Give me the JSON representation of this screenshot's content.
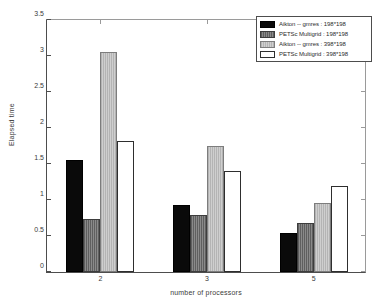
{
  "chart_data": {
    "type": "bar",
    "title": "",
    "xlabel": "number of processors",
    "ylabel": "Elapsed time",
    "categories": [
      "2",
      "3",
      "5"
    ],
    "ylim": [
      0,
      3.5
    ],
    "yticks": [
      "0",
      "0.5",
      "1",
      "1.5",
      "2",
      "2.5",
      "3",
      "3.5"
    ],
    "ytick_values": [
      0,
      0.5,
      1,
      1.5,
      2,
      2.5,
      3,
      3.5
    ],
    "grid": false,
    "legend_position": "top-right",
    "series": [
      {
        "name": "Aikton -- gmres : 198*198",
        "color": "#0a0a0a",
        "values": [
          1.54,
          0.92,
          0.54
        ]
      },
      {
        "name": "PETSc Multigrid : 198*198",
        "color": "#767676",
        "values": [
          0.73,
          0.78,
          0.68
        ]
      },
      {
        "name": "Aikton -- gmres : 398*198",
        "color": "#c2c2c2",
        "values": [
          3.03,
          1.74,
          0.95
        ]
      },
      {
        "name": "PETSc Multigrid : 398*198",
        "color": "#ffffff",
        "values": [
          1.8,
          1.39,
          1.19
        ]
      }
    ]
  },
  "legend": {
    "entries": [
      "Aikton -- gmres : 198*198",
      "PETSc Multigrid : 198*198",
      "Aikton -- gmres : 398*198",
      "PETSc Multigrid : 398*198"
    ]
  }
}
